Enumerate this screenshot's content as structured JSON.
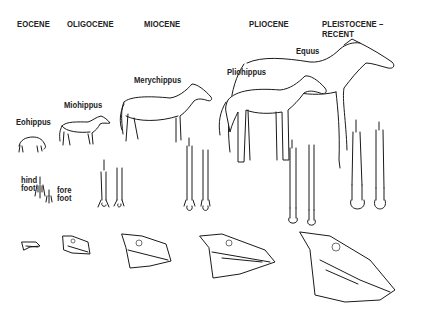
{
  "diagram": {
    "epochs": [
      {
        "label": "EOCENE"
      },
      {
        "label": "OLIGOCENE"
      },
      {
        "label": "MIOCENE"
      },
      {
        "label": "PLIOCENE"
      },
      {
        "label": "PLEISTOCENE – RECENT"
      }
    ],
    "species": [
      {
        "label": "Eohippus",
        "epoch": "EOCENE"
      },
      {
        "label": "Miohippus",
        "epoch": "OLIGOCENE"
      },
      {
        "label": "Merychippus",
        "epoch": "MIOCENE"
      },
      {
        "label": "Pliohippus",
        "epoch": "PLIOCENE"
      },
      {
        "label": "Equus",
        "epoch": "PLEISTOCENE – RECENT"
      }
    ],
    "foot_labels": {
      "hind": "hind\nfoot",
      "hind_line1": "hind",
      "hind_line2": "foot",
      "fore_line1": "fore",
      "fore_line2": "foot"
    },
    "rows": [
      "animal body",
      "hind and fore foot bones",
      "skull"
    ],
    "colors": {
      "ink": "#1a1a1a",
      "background": "#ffffff"
    }
  }
}
